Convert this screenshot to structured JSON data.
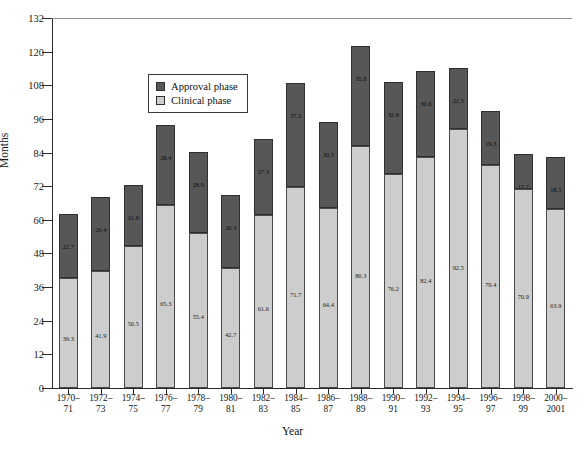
{
  "chart_data": {
    "type": "bar",
    "subtype": "stacked-vertical",
    "title": "",
    "xlabel": "Year",
    "ylabel": "Months",
    "ylim": [
      0,
      132
    ],
    "yticks": [
      0,
      12,
      24,
      36,
      48,
      60,
      72,
      84,
      96,
      108,
      120,
      132
    ],
    "grid": false,
    "legend_position": "upper-left-inside",
    "categories": [
      "1970–71",
      "1972–73",
      "1974–75",
      "1976–77",
      "1978–79",
      "1980–81",
      "1982–83",
      "1984–85",
      "1986–87",
      "1988–89",
      "1990–91",
      "1992–93",
      "1994–95",
      "1996–97",
      "1998–99",
      "2000–2001"
    ],
    "series": [
      {
        "name": "Clinical phase",
        "color": "#cdcdcd",
        "values": [
          39.3,
          41.9,
          50.5,
          65.3,
          55.4,
          42.7,
          61.6,
          71.7,
          64.4,
          86.3,
          76.2,
          82.4,
          92.5,
          79.4,
          70.9,
          63.9
        ]
      },
      {
        "name": "Approval phase",
        "color": "#575757",
        "values": [
          22.7,
          26.4,
          21.8,
          28.4,
          28.9,
          26.3,
          27.3,
          37.2,
          30.5,
          35.8,
          32.8,
          30.6,
          21.5,
          19.3,
          12.7,
          18.5
        ]
      }
    ],
    "totals": [
      62.0,
      68.3,
      72.3,
      93.7,
      84.3,
      69.0,
      88.9,
      108.9,
      94.9,
      122.1,
      109.0,
      113.0,
      114.0,
      98.7,
      83.6,
      82.4
    ]
  },
  "axis": {
    "y_title": "Months",
    "x_title": "Year",
    "y_tick_labels": [
      "0",
      "12",
      "24",
      "36",
      "48",
      "60",
      "72",
      "84",
      "96",
      "108",
      "120",
      "132"
    ],
    "x_tick_labels": [
      {
        "top": "1970–",
        "bottom": "71"
      },
      {
        "top": "1972–",
        "bottom": "73"
      },
      {
        "top": "1974–",
        "bottom": "75"
      },
      {
        "top": "1976–",
        "bottom": "77"
      },
      {
        "top": "1978–",
        "bottom": "79"
      },
      {
        "top": "1980–",
        "bottom": "81"
      },
      {
        "top": "1982–",
        "bottom": "83"
      },
      {
        "top": "1984–",
        "bottom": "85"
      },
      {
        "top": "1986–",
        "bottom": "87"
      },
      {
        "top": "1988–",
        "bottom": "89"
      },
      {
        "top": "1990–",
        "bottom": "91"
      },
      {
        "top": "1992–",
        "bottom": "93"
      },
      {
        "top": "1994–",
        "bottom": "95"
      },
      {
        "top": "1996–",
        "bottom": "97"
      },
      {
        "top": "1998–",
        "bottom": "99"
      },
      {
        "top": "2000–",
        "bottom": "2001"
      }
    ]
  },
  "legend": {
    "items": [
      {
        "label": "Approval phase",
        "color": "#575757"
      },
      {
        "label": "Clinical phase",
        "color": "#cdcdcd"
      }
    ]
  }
}
